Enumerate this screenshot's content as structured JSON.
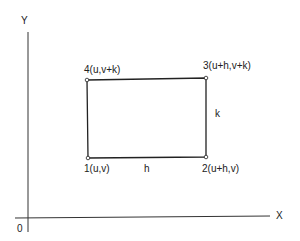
{
  "diagram": {
    "axes": {
      "y_label": "Y",
      "x_label": "X",
      "origin_label": "0"
    },
    "rectangle": {
      "corners": [
        {
          "id": "1",
          "label": "1(u,v)"
        },
        {
          "id": "2",
          "label": "2(u+h,v)"
        },
        {
          "id": "3",
          "label": "3(u+h,v+k)"
        },
        {
          "id": "4",
          "label": "4(u,v+k)"
        }
      ],
      "width_label": "h",
      "height_label": "k"
    },
    "colors": {
      "stroke": "#222222",
      "background": "#ffffff"
    }
  }
}
